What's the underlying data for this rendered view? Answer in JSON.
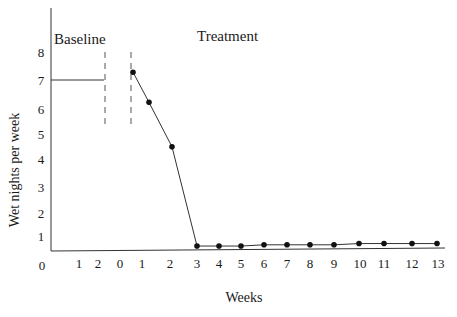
{
  "chart_data": {
    "type": "line",
    "title": "",
    "xlabel": "Weeks",
    "ylabel": "Wet nights per week",
    "ylim": [
      0,
      8
    ],
    "yticks": [
      0,
      1,
      2,
      3,
      4,
      5,
      6,
      7,
      8
    ],
    "xtick_labels": [
      "0",
      "1",
      "2",
      "0",
      "1",
      "2",
      "3",
      "4",
      "5",
      "6",
      "7",
      "8",
      "9",
      "10",
      "11",
      "12",
      "13"
    ],
    "grid": false,
    "legend": null,
    "phases": [
      {
        "name": "Baseline",
        "label": "Baseline"
      },
      {
        "name": "Treatment",
        "label": "Treatment"
      }
    ],
    "annotations": [
      "Baseline",
      "Treatment"
    ],
    "series": [
      {
        "name": "Baseline",
        "style": "line-no-markers",
        "x": [
          0,
          2
        ],
        "values": [
          7,
          7
        ]
      },
      {
        "name": "Treatment",
        "style": "line-with-markers",
        "x": [
          0.5,
          1,
          2,
          3,
          4,
          5,
          6,
          7,
          8,
          9,
          10,
          11,
          12,
          13
        ],
        "values": [
          7.0,
          5.9,
          4.2,
          0.2,
          0.2,
          0.2,
          0.25,
          0.25,
          0.25,
          0.25,
          0.3,
          0.3,
          0.3,
          0.3
        ]
      }
    ]
  }
}
